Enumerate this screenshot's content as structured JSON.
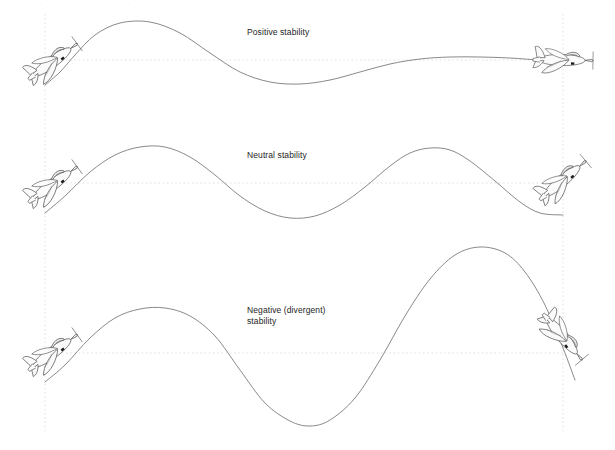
{
  "figure": {
    "background_color": "#ffffff",
    "width": 615,
    "height": 450,
    "curve_color": "#6b6b6b",
    "reference_line_color": "#dedede",
    "aircraft_outline_color": "#585858",
    "aircraft_fill_color": "#fbfbfb",
    "label_color": "#242424"
  },
  "top_partial_text": " ",
  "rows": [
    {
      "id": "positive",
      "label": "Positive stability",
      "description": "Damped oscillation converging back to the trimmed flight path",
      "reference_y": 60,
      "start_aircraft_attitude": "nose-up-climb",
      "end_aircraft_attitude": "level",
      "amplitude_behavior": "decreasing"
    },
    {
      "id": "neutral",
      "label": "Neutral stability",
      "description": "Constant amplitude oscillation about the trimmed flight path",
      "reference_y": 183,
      "start_aircraft_attitude": "nose-up-climb",
      "end_aircraft_attitude": "nose-up-climb",
      "amplitude_behavior": "constant"
    },
    {
      "id": "negative",
      "label": "Negative (divergent)\nstability",
      "description": "Divergent oscillation with growing amplitude away from the trimmed flight path",
      "reference_y": 353,
      "start_aircraft_attitude": "nose-up-climb",
      "end_aircraft_attitude": "nose-down-dive",
      "amplitude_behavior": "increasing"
    }
  ],
  "chart_data": {
    "type": "line",
    "xlabel": "",
    "ylabel": "",
    "grid": false,
    "legend_position": "inline-annotation",
    "xlim": [
      45,
      563
    ],
    "ylim": [
      450,
      0
    ],
    "axis_note": "y axis in screen pixels, smaller value = higher on page",
    "reference_lines": {
      "horizontal_y": [
        60,
        183,
        353
      ],
      "vertical_x": [
        45,
        563
      ],
      "style": "dotted",
      "color": "#dedede"
    },
    "series": [
      {
        "name": "Positive stability",
        "color": "#6b6b6b",
        "annotation": "Positive stability",
        "baseline": 60,
        "points": [
          [
            45,
            85
          ],
          [
            60,
            72
          ],
          [
            75,
            55
          ],
          [
            95,
            35
          ],
          [
            120,
            23
          ],
          [
            150,
            22
          ],
          [
            180,
            33
          ],
          [
            210,
            53
          ],
          [
            240,
            72
          ],
          [
            270,
            82
          ],
          [
            300,
            84
          ],
          [
            330,
            80
          ],
          [
            360,
            72
          ],
          [
            390,
            64
          ],
          [
            420,
            59
          ],
          [
            450,
            57
          ],
          [
            480,
            57
          ],
          [
            510,
            58
          ],
          [
            540,
            60
          ],
          [
            563,
            60
          ]
        ]
      },
      {
        "name": "Neutral stability",
        "color": "#6b6b6b",
        "annotation": "Neutral stability",
        "baseline": 183,
        "points": [
          [
            45,
            213
          ],
          [
            65,
            196
          ],
          [
            90,
            172
          ],
          [
            115,
            155
          ],
          [
            140,
            147
          ],
          [
            165,
            147
          ],
          [
            190,
            157
          ],
          [
            215,
            175
          ],
          [
            240,
            196
          ],
          [
            265,
            211
          ],
          [
            290,
            218
          ],
          [
            315,
            216
          ],
          [
            340,
            205
          ],
          [
            365,
            187
          ],
          [
            390,
            166
          ],
          [
            410,
            153
          ],
          [
            430,
            148
          ],
          [
            450,
            150
          ],
          [
            470,
            161
          ],
          [
            495,
            181
          ],
          [
            520,
            202
          ],
          [
            540,
            213
          ],
          [
            563,
            215
          ]
        ]
      },
      {
        "name": "Negative (divergent) stability",
        "color": "#6b6b6b",
        "annotation": "Negative (divergent)\nstability",
        "baseline": 353,
        "points": [
          [
            45,
            382
          ],
          [
            65,
            365
          ],
          [
            90,
            338
          ],
          [
            115,
            318
          ],
          [
            140,
            309
          ],
          [
            165,
            308
          ],
          [
            190,
            316
          ],
          [
            215,
            336
          ],
          [
            240,
            370
          ],
          [
            265,
            403
          ],
          [
            290,
            421
          ],
          [
            310,
            426
          ],
          [
            330,
            420
          ],
          [
            355,
            398
          ],
          [
            380,
            360
          ],
          [
            405,
            316
          ],
          [
            430,
            279
          ],
          [
            455,
            255
          ],
          [
            480,
            247
          ],
          [
            505,
            253
          ],
          [
            525,
            272
          ],
          [
            545,
            305
          ],
          [
            563,
            348
          ],
          [
            575,
            380
          ]
        ]
      }
    ]
  },
  "aircraft": [
    {
      "id": "positive-start",
      "x": 52,
      "y": 62,
      "rotation": -36,
      "scale": 1.0,
      "attitude": "nose-up-climb"
    },
    {
      "id": "positive-end",
      "x": 562,
      "y": 60,
      "rotation": 1,
      "scale": 1.0,
      "attitude": "level"
    },
    {
      "id": "neutral-start",
      "x": 52,
      "y": 185,
      "rotation": -36,
      "scale": 1.0,
      "attitude": "nose-up-climb"
    },
    {
      "id": "neutral-end",
      "x": 562,
      "y": 181,
      "rotation": -40,
      "scale": 1.0,
      "attitude": "nose-up-climb"
    },
    {
      "id": "negative-start",
      "x": 52,
      "y": 353,
      "rotation": -36,
      "scale": 1.0,
      "attitude": "nose-up-climb"
    },
    {
      "id": "negative-end",
      "x": 562,
      "y": 336,
      "rotation": 50,
      "scale": 1.0,
      "attitude": "nose-down-dive"
    }
  ]
}
